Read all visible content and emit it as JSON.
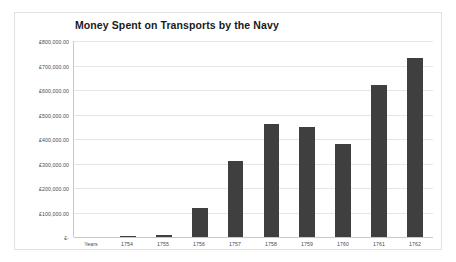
{
  "chart_data": {
    "type": "bar",
    "title": "Money Spent on Transports by the Navy",
    "xlabel": "",
    "ylabel": "",
    "categories": [
      "Years",
      "1754",
      "1755",
      "1756",
      "1757",
      "1758",
      "1759",
      "1760",
      "1761",
      "1762"
    ],
    "values": [
      0,
      2000,
      10000,
      120000,
      312000,
      462000,
      448000,
      378000,
      622000,
      730000
    ],
    "ylim": [
      0,
      800000
    ],
    "ytick_values": [
      0,
      100000,
      200000,
      300000,
      400000,
      500000,
      600000,
      700000,
      800000
    ],
    "ytick_labels": [
      "£-",
      "£100,000.00",
      "£200,000.00",
      "£300,000.00",
      "£400,000.00",
      "£500,000.00",
      "£600,000.00",
      "£700,000.00",
      "£800,000.00"
    ],
    "grid": true,
    "legend": false,
    "bar_color": "#3f3f3f",
    "gridline_color": "#e6e6e6",
    "axis_color": "#c9c9c9",
    "plot_background": "#ffffff"
  }
}
